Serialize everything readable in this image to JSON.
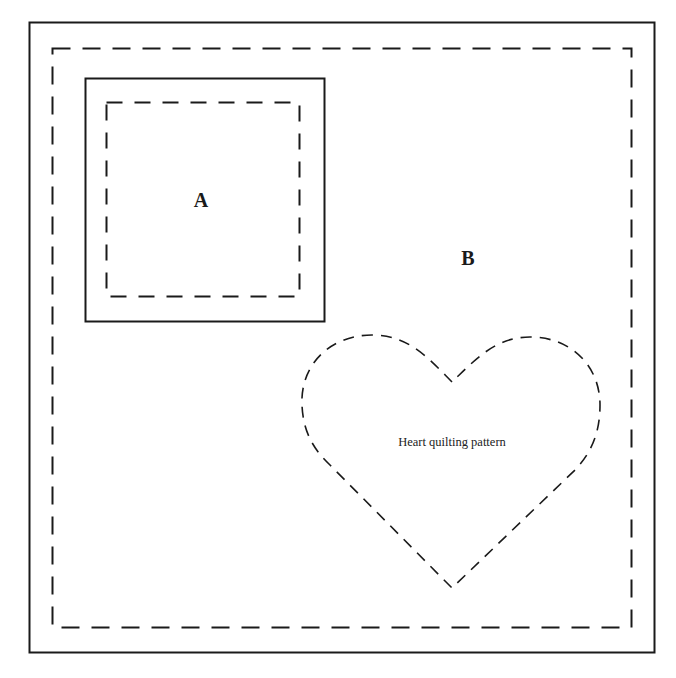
{
  "diagram": {
    "type": "quilt-block-pattern",
    "colors": {
      "line": "#1a1a1a",
      "background": "#ffffff"
    },
    "labels": {
      "a": "A",
      "b": "B",
      "heart": "Heart quilting pattern"
    },
    "shapes": {
      "outer_solid": {
        "x": 29,
        "y": 22,
        "w": 625,
        "h": 630
      },
      "outer_dashed": {
        "x": 52,
        "y": 48,
        "w": 579,
        "h": 579
      },
      "square_a_solid": {
        "x": 85,
        "y": 78,
        "w": 239,
        "h": 243
      },
      "square_a_dashed": {
        "x": 106,
        "y": 102,
        "w": 193,
        "h": 194
      }
    }
  }
}
